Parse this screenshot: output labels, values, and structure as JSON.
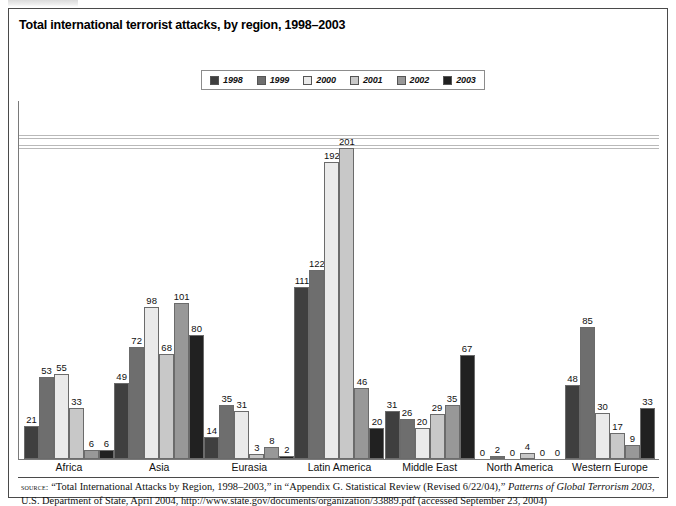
{
  "figure": {
    "title": "Total international terrorist attacks, by region, 1998–2003"
  },
  "legend": {
    "items": [
      {
        "label": "1998",
        "color": "#3f3f3f"
      },
      {
        "label": "1999",
        "color": "#6e6e6e"
      },
      {
        "label": "2000",
        "color": "#eaeaea"
      },
      {
        "label": "2001",
        "color": "#c8c8c8"
      },
      {
        "label": "2002",
        "color": "#989898"
      },
      {
        "label": "2003",
        "color": "#212121"
      }
    ]
  },
  "source": {
    "keyword": "source:",
    "line1_a": " “Total International Attacks by Region, 1998–2003,” in “Appendix G. Statistical Review (Revised 6/22/04),” ",
    "line1_italic": "Patterns of Global Terrorism 2003",
    "line1_b": ",",
    "line2": "U.S. Department of State, April 2004, http://www.state.gov/documents/organization/33889.pdf (accessed September 23, 2004)"
  },
  "chart_data": {
    "type": "bar",
    "title": "Total international terrorist attacks, by region, 1998–2003",
    "xlabel": "",
    "ylabel": "",
    "ylim": [
      0,
      215
    ],
    "grid": false,
    "legend_position": "top-center",
    "categories": [
      "Africa",
      "Asia",
      "Eurasia",
      "Latin America",
      "Middle East",
      "North America",
      "Western Europe"
    ],
    "series": [
      {
        "name": "1998",
        "color": "#3f3f3f",
        "values": [
          21,
          49,
          14,
          111,
          31,
          0,
          48
        ]
      },
      {
        "name": "1999",
        "color": "#6e6e6e",
        "values": [
          53,
          72,
          35,
          122,
          26,
          2,
          85
        ]
      },
      {
        "name": "2000",
        "color": "#eaeaea",
        "values": [
          55,
          98,
          31,
          192,
          20,
          0,
          30
        ]
      },
      {
        "name": "2001",
        "color": "#c8c8c8",
        "values": [
          33,
          68,
          3,
          201,
          29,
          4,
          17
        ]
      },
      {
        "name": "2002",
        "color": "#989898",
        "values": [
          6,
          101,
          8,
          46,
          35,
          0,
          9
        ]
      },
      {
        "name": "2003",
        "color": "#212121",
        "values": [
          6,
          80,
          2,
          20,
          67,
          0,
          33
        ]
      }
    ]
  }
}
